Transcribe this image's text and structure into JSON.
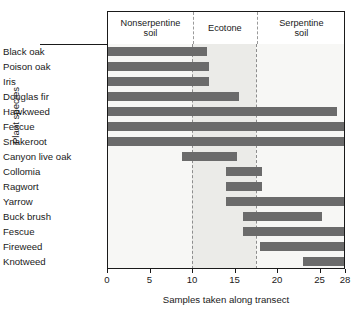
{
  "chart_data": {
    "type": "bar",
    "orientation": "horizontal",
    "title": "",
    "xlabel": "Samples taken along transect",
    "ylabel": "Plant species",
    "xlim": [
      0,
      28
    ],
    "xticks": [
      0,
      5,
      10,
      15,
      20,
      25,
      28
    ],
    "xtick_labels": [
      "0",
      "5",
      "10",
      "15",
      "20",
      "25",
      "28"
    ],
    "grid": false,
    "legend": "none",
    "bar_color": "#6b6b6b",
    "categories": [
      "Black oak",
      "Poison oak",
      "Iris",
      "Douglas fir",
      "Hawkweed",
      "Fescue",
      "Snakeroot",
      "Canyon live oak",
      "Collomia",
      "Ragwort",
      "Yarrow",
      "Buck brush",
      "Fescue",
      "Fireweed",
      "Knotweed"
    ],
    "bars": [
      {
        "species": "Black oak",
        "start": 0,
        "end": 11.8
      },
      {
        "species": "Poison oak",
        "start": 0,
        "end": 12.0
      },
      {
        "species": "Iris",
        "start": 0,
        "end": 12.0
      },
      {
        "species": "Douglas fir",
        "start": 0,
        "end": 15.5
      },
      {
        "species": "Hawkweed",
        "start": 0,
        "end": 27.0
      },
      {
        "species": "Fescue",
        "start": 0,
        "end": 28.0
      },
      {
        "species": "Snakeroot",
        "start": 0,
        "end": 28.0
      },
      {
        "species": "Canyon live oak",
        "start": 8.8,
        "end": 15.3
      },
      {
        "species": "Collomia",
        "start": 14.0,
        "end": 18.2
      },
      {
        "species": "Ragwort",
        "start": 14.0,
        "end": 18.2
      },
      {
        "species": "Yarrow",
        "start": 14.0,
        "end": 28.0
      },
      {
        "species": "Buck brush",
        "start": 16.0,
        "end": 25.3
      },
      {
        "species": "Fescue",
        "start": 16.0,
        "end": 28.0
      },
      {
        "species": "Fireweed",
        "start": 18.0,
        "end": 28.0
      },
      {
        "species": "Knotweed",
        "start": 23.0,
        "end": 28.0
      }
    ],
    "zones": [
      {
        "label": "Nonserpentine\nsoil",
        "label_line1": "Nonserpentine",
        "label_line2": "soil",
        "start": 0,
        "end": 10.0
      },
      {
        "label": "Ecotone",
        "label_line1": "Ecotone",
        "label_line2": "",
        "start": 10.0,
        "end": 17.5
      },
      {
        "label": "Serpentine\nsoil",
        "label_line1": "Serpentine",
        "label_line2": "soil",
        "start": 17.5,
        "end": 28.0
      }
    ],
    "zone_boundaries": [
      10.0,
      17.5
    ],
    "annotations": []
  }
}
